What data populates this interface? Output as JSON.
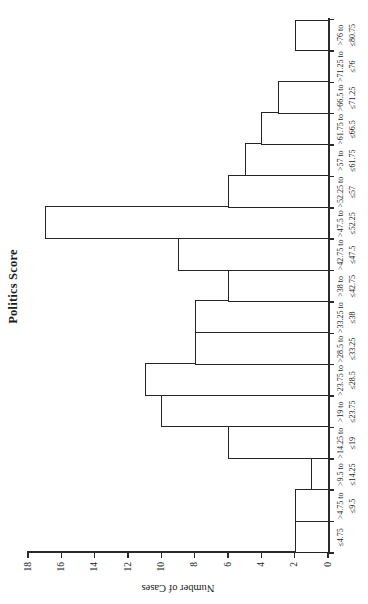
{
  "chart_data": {
    "type": "bar",
    "chart_kind": "histogram",
    "title": "Politics Score",
    "xlabel": "",
    "ylabel": "Number of Cases",
    "categories": [
      "≤4.75",
      ">4.75 to ≤9.5",
      ">9.5 to ≤14.25",
      ">14.25 to ≤19",
      ">19 to ≤23.75",
      ">23.75 to ≤28.5",
      ">28.5 to ≤33.25",
      ">33.25 to ≤38",
      ">38 to ≤42.75",
      ">42.75 to ≤47.5",
      ">47.5 to ≤52.25",
      ">52.25 to ≤57",
      ">57 to ≤61.75",
      ">61.75 to ≤66.5",
      ">66.5 to ≤71.25",
      ">71.25 to ≤76",
      ">76 to ≤80.75"
    ],
    "category_label_lines": [
      [
        "≤4.75"
      ],
      [
        ">4.75 to",
        "≤9.5"
      ],
      [
        ">9.5 to",
        "≤14.25"
      ],
      [
        ">14.25 to",
        "≤19"
      ],
      [
        ">19 to",
        "≤23.75"
      ],
      [
        ">23.75 to",
        "≤28.5"
      ],
      [
        ">28.5 to",
        "≤33.25"
      ],
      [
        ">33.25 to",
        "≤38"
      ],
      [
        ">38 to",
        "≤42.75"
      ],
      [
        ">42.75 to",
        "≤47.5"
      ],
      [
        ">47.5 to",
        "≤52.25"
      ],
      [
        ">52.25 to",
        "≤57"
      ],
      [
        ">57 to",
        "≤61.75"
      ],
      [
        ">61.75 to",
        "≤66.5"
      ],
      [
        ">66.5 to",
        "≤71.25"
      ],
      [
        ">71.25 to",
        "≤76"
      ],
      [
        ">76 to",
        "≤80.75"
      ]
    ],
    "values": [
      2,
      2,
      1,
      6,
      10,
      11,
      8,
      8,
      6,
      9,
      17,
      6,
      5,
      4,
      3,
      0,
      2
    ],
    "total_cases": 100,
    "ylim": [
      0,
      18
    ],
    "yticks": [
      0,
      2,
      4,
      6,
      8,
      10,
      12,
      14,
      16,
      18
    ],
    "grid": "off",
    "legend": "none",
    "layout_hint": "landscape chart rotated 90 degrees counterclockwise into portrait frame",
    "bar_fill": "#ffffff",
    "bar_border": "#242424",
    "axis_color": "#2b2b2b",
    "text_color": "#1c1c1c",
    "background": "#ffffff"
  }
}
